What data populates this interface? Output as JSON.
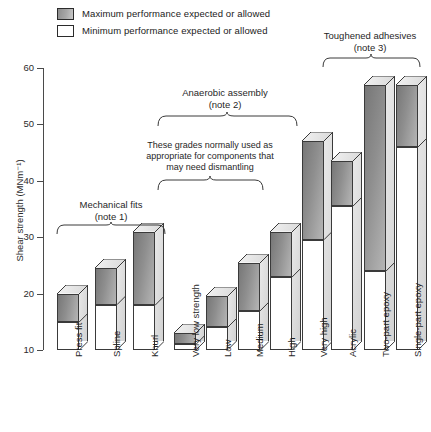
{
  "legend": {
    "items": [
      {
        "key": "max",
        "label": "Maximum performance expected or allowed",
        "swatch": "gray-filled-square"
      },
      {
        "key": "min",
        "label": "Minimum performance expected or allowed",
        "swatch": "white-square"
      }
    ]
  },
  "annotations": {
    "mechanical_fits": "Mechanical fits",
    "mechanical_fits_note": "(note 1)",
    "anaerobic": "Anaerobic assembly",
    "anaerobic_note": "(note 2)",
    "toughened": "Toughened adhesives",
    "toughened_note": "(note 3)",
    "dismantle_line1": "These grades normally used as",
    "dismantle_line2": "appropriate for components that",
    "dismantle_line3": "may need dismantling"
  },
  "chart_data": {
    "type": "bar",
    "title": "",
    "xlabel": "",
    "ylabel": "Shear strength (MNm⁻¹)",
    "ylim": [
      10,
      60
    ],
    "yticks": [
      10,
      20,
      30,
      40,
      50,
      60
    ],
    "ytick_labels": [
      "10",
      "20",
      "30",
      "40",
      "50",
      "60"
    ],
    "grid": false,
    "legend_position": "top-left",
    "categories": [
      "Press fit",
      "Spline",
      "Knurl",
      "Very low strength",
      "Low",
      "Medium",
      "High",
      "Very high",
      "Acrylic",
      "Two-part epoxy",
      "Single-part epoxy"
    ],
    "series": [
      {
        "name": "Minimum performance expected or allowed",
        "values": [
          15,
          18,
          18,
          11,
          14,
          17,
          23,
          29.5,
          35.5,
          24,
          46
        ]
      },
      {
        "name": "Maximum performance expected or allowed",
        "values": [
          20,
          24.5,
          31,
          13,
          19.5,
          25.5,
          31,
          47,
          43.5,
          57,
          57
        ]
      }
    ],
    "groups": [
      {
        "name": "Mechanical fits",
        "note": "(note 1)",
        "from": 0,
        "to": 2
      },
      {
        "name": "Anaerobic assembly",
        "note": "(note 2)",
        "from": 3,
        "to": 7
      },
      {
        "name": "Toughened adhesives",
        "note": "(note 3)",
        "from": 9,
        "to": 10
      }
    ],
    "subgroups": [
      {
        "name": "These grades normally used as appropriate for components that may need dismantling",
        "from": 3,
        "to": 6
      }
    ],
    "colors": {
      "max": "#8f8f8f",
      "min": "#ffffff",
      "outline": "#3a3a3a",
      "axis": "#4a4a4a"
    }
  }
}
